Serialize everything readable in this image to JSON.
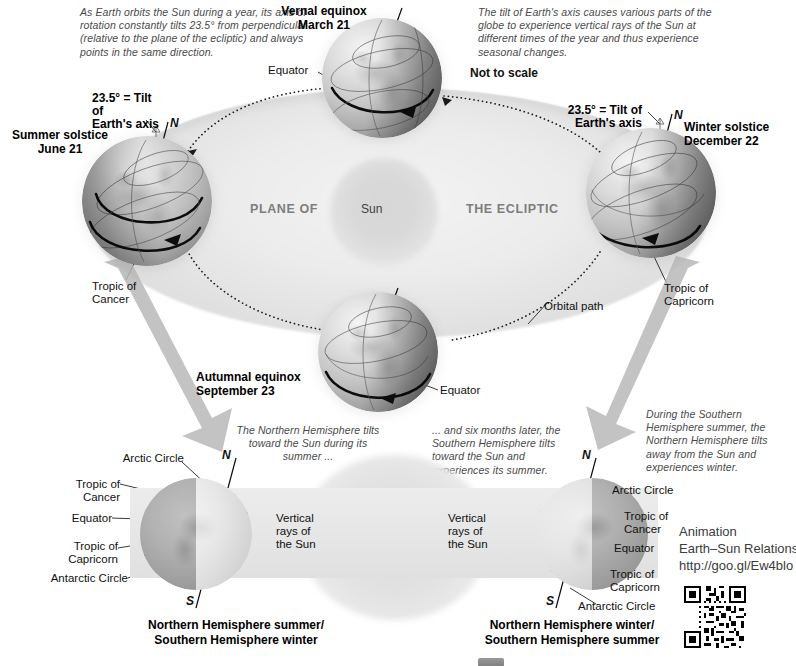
{
  "diagram": {
    "not_to_scale": "Not to scale"
  },
  "notes": {
    "top_left": "As Earth orbits the Sun during a year, its axis of rotation constantly tilts 23.5° from perpendicular (relative to the plane of the ecliptic) and always points in the same direction.",
    "top_right": "The tilt of Earth's axis causes various parts of the globe to experience vertical rays of the Sun at different times of the year and thus experience seasonal changes.",
    "bottom_left": "The Northern Hemisphere tilts toward the Sun during its summer ...",
    "bottom_middle": "... and six months later, the Southern Hemisphere tilts toward the Sun and experiences its summer.",
    "bottom_right": "During the Southern Hemisphere summer, the Northern Hemisphere tilts away from the Sun and experiences winter."
  },
  "plane": {
    "left_words": "PLANE OF",
    "right_words": "THE ECLIPTIC",
    "sun_label": "Sun",
    "orbital_path": "Orbital path"
  },
  "positions": [
    {
      "name": "vernal-equinox",
      "event": "Vernal equinox",
      "date": "March 21",
      "sublabel": "Equator"
    },
    {
      "name": "summer-solstice",
      "event": "Summer solstice",
      "date": "June 21",
      "sublabel": "Tropic of Cancer"
    },
    {
      "name": "autumnal-equinox",
      "event": "Autumnal equinox",
      "date": "September 23",
      "sublabel": "Equator"
    },
    {
      "name": "winter-solstice",
      "event": "Winter solstice",
      "date": "December 22",
      "sublabel": "Tropic of Capricorn"
    }
  ],
  "tilt": {
    "label_line1": "23.5° = Tilt of",
    "label_line2": "Earth's axis",
    "north_pole": "N",
    "south_pole": "S"
  },
  "lower_panel": {
    "left": {
      "rays_label": "Vertical rays of the Sun",
      "rays_l1": "Vertical",
      "rays_l2": "rays of",
      "rays_l3": "the Sun",
      "caption_line1": "Northern Hemisphere summer/",
      "caption_line2": "Southern Hemisphere winter",
      "circles": [
        "Arctic Circle",
        "Tropic of Cancer",
        "Equator",
        "Tropic of Capricorn",
        "Antarctic Circle"
      ]
    },
    "right": {
      "rays_label": "Vertical rays of the Sun",
      "rays_l1": "Vertical",
      "rays_l2": "rays of",
      "rays_l3": "the Sun",
      "caption_line1": "Northern Hemisphere winter/",
      "caption_line2": "Southern Hemisphere summer",
      "circles": [
        "Arctic Circle",
        "Tropic of Cancer",
        "Equator",
        "Tropic of Capricorn",
        "Antarctic Circle"
      ]
    }
  },
  "animation": {
    "line1": "Animation",
    "line2": "Earth–Sun Relations",
    "line3": "http://goo.gl/Ew4blo"
  },
  "colors": {
    "ink": "#111111",
    "muted": "#4a4a4a",
    "plane_text": "#7d7d7d",
    "band": "#e8e8e8",
    "arrow_gray": "#b9b9b9"
  }
}
